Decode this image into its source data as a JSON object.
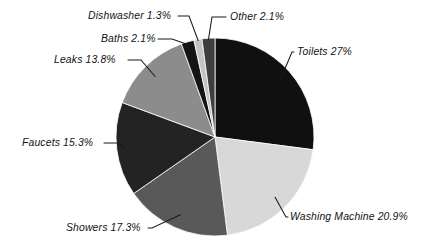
{
  "chart_data": {
    "type": "pie",
    "title": "",
    "subtitle": "",
    "xlabel": "",
    "ylabel": "",
    "legend_position": "none",
    "grid": false,
    "units": "percent",
    "start_angle_deg": 0,
    "direction": "clockwise",
    "total": 100.0,
    "categories": [
      "Toilets",
      "Washing Machine",
      "Showers",
      "Faucets",
      "Leaks",
      "Baths",
      "Dishwasher",
      "Other"
    ],
    "values": [
      27.0,
      20.9,
      17.3,
      15.3,
      13.8,
      2.1,
      1.3,
      2.1
    ],
    "slices": [
      {
        "name": "Toilets",
        "value": 27.0,
        "label": "Toilets 27%",
        "color": "#101010"
      },
      {
        "name": "Washing Machine",
        "value": 20.9,
        "label": "Washing Machine 20.9%",
        "color": "#d8d8d8"
      },
      {
        "name": "Showers",
        "value": 17.3,
        "label": "Showers 17.3%",
        "color": "#595959"
      },
      {
        "name": "Faucets",
        "value": 15.3,
        "label": "Faucets 15.3%",
        "color": "#232323"
      },
      {
        "name": "Leaks",
        "value": 13.8,
        "label": "Leaks 13.8%",
        "color": "#8c8c8c"
      },
      {
        "name": "Baths",
        "value": 2.1,
        "label": "Baths 2.1%",
        "color": "#141414"
      },
      {
        "name": "Dishwasher",
        "value": 1.3,
        "label": "Dishwasher 1.3%",
        "color": "#c4c4c4"
      },
      {
        "name": "Other",
        "value": 2.1,
        "label": "Other 2.1%",
        "color": "#3e3e3e"
      }
    ]
  },
  "geometry": {
    "center_x": 215,
    "center_y": 137,
    "radius": 99
  },
  "colors": {
    "background": "#ffffff",
    "text": "#131313",
    "leader": "#1a1a1a"
  }
}
